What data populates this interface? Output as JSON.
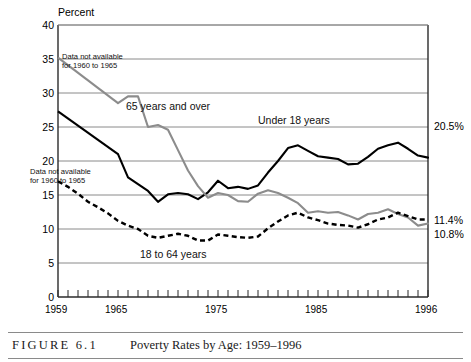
{
  "figure": {
    "number_label": "FIGURE 6.1",
    "title": "Poverty Rates by Age: 1959–1996"
  },
  "axis": {
    "y_title": "Percent",
    "y_ticks": [
      "40",
      "35",
      "30",
      "25",
      "20",
      "15",
      "10",
      "5",
      "0"
    ],
    "x_ticks": [
      "1959",
      "1965",
      "1975",
      "1985",
      "1996"
    ]
  },
  "annotations": [
    {
      "name": "note-65-and-over",
      "line1": "Data not available",
      "line2": "for 1960 to 1965"
    },
    {
      "name": "note-under-18",
      "line1": "Data not available",
      "line2": "for 1960 to 1965"
    }
  ],
  "series_labels": {
    "over65": "65 years and over",
    "under18": "Under 18 years",
    "adults": "18 to 64 years"
  },
  "end_values": {
    "under18": "20.5%",
    "adults": "11.4%",
    "over65": "10.8%"
  },
  "colors": {
    "under18": "#000000",
    "over65": "#8c8c8c",
    "adults": "#000000",
    "grid": "#8a8a8a",
    "axis": "#2b2b2b",
    "background": "#ffffff"
  },
  "chart_data": {
    "type": "line",
    "title": "Poverty Rates by Age: 1959–1996",
    "xlabel": "",
    "ylabel": "Percent",
    "xlim": [
      1959,
      1996
    ],
    "ylim": [
      0,
      40
    ],
    "grid": true,
    "legend": "inline-labels",
    "x": [
      1959,
      1960,
      1961,
      1962,
      1963,
      1964,
      1965,
      1966,
      1967,
      1968,
      1969,
      1970,
      1971,
      1972,
      1973,
      1974,
      1975,
      1976,
      1977,
      1978,
      1979,
      1980,
      1981,
      1982,
      1983,
      1984,
      1985,
      1986,
      1987,
      1988,
      1989,
      1990,
      1991,
      1992,
      1993,
      1994,
      1995,
      1996
    ],
    "series": [
      {
        "name": "Under 18 years",
        "color": "#000000",
        "style": "solid",
        "gap_years": [
          1960,
          1961,
          1962,
          1963,
          1964
        ],
        "values": [
          27.3,
          null,
          null,
          null,
          null,
          null,
          21.0,
          17.6,
          16.6,
          15.6,
          14.0,
          15.1,
          15.3,
          15.1,
          14.4,
          15.4,
          17.1,
          16.0,
          16.2,
          15.9,
          16.4,
          18.3,
          20.0,
          21.9,
          22.3,
          21.5,
          20.7,
          20.5,
          20.3,
          19.5,
          19.6,
          20.6,
          21.8,
          22.3,
          22.7,
          21.8,
          20.8,
          20.5
        ]
      },
      {
        "name": "65 years and over",
        "color": "#8c8c8c",
        "style": "solid",
        "gap_years": [
          1960,
          1961,
          1962,
          1963,
          1964
        ],
        "values": [
          35.2,
          null,
          null,
          null,
          null,
          null,
          28.5,
          29.5,
          29.5,
          25.0,
          25.3,
          24.6,
          21.6,
          18.6,
          16.3,
          14.6,
          15.3,
          15.0,
          14.1,
          14.0,
          15.2,
          15.7,
          15.3,
          14.6,
          13.8,
          12.4,
          12.6,
          12.4,
          12.5,
          12.0,
          11.4,
          12.2,
          12.4,
          12.9,
          12.2,
          11.7,
          10.5,
          10.8
        ]
      },
      {
        "name": "18 to 64 years",
        "color": "#000000",
        "style": "dashed",
        "gap_years": [],
        "values": [
          17.0,
          16.2,
          15.2,
          14.0,
          13.2,
          12.3,
          11.2,
          10.5,
          10.0,
          9.0,
          8.7,
          9.0,
          9.3,
          9.0,
          8.3,
          8.3,
          9.2,
          9.0,
          8.8,
          8.7,
          8.9,
          10.1,
          11.1,
          12.0,
          12.4,
          11.7,
          11.3,
          10.8,
          10.6,
          10.5,
          10.2,
          10.7,
          11.4,
          11.7,
          12.4,
          11.9,
          11.4,
          11.4
        ]
      }
    ],
    "endpoint_labels": [
      {
        "series": "Under 18 years",
        "value": 20.5,
        "text": "20.5%"
      },
      {
        "series": "18 to 64 years",
        "value": 11.4,
        "text": "11.4%"
      },
      {
        "series": "65 years and over",
        "value": 10.8,
        "text": "10.8%"
      }
    ]
  }
}
